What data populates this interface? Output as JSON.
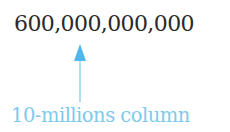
{
  "diagram": {
    "number": "600,000,000,000",
    "label": "10-millions column",
    "arrow_icon": "up-arrow-icon",
    "colors": {
      "number": "#2a2a2a",
      "accent": "#7ccbea",
      "arrow_head": "#4fb7ea"
    }
  }
}
